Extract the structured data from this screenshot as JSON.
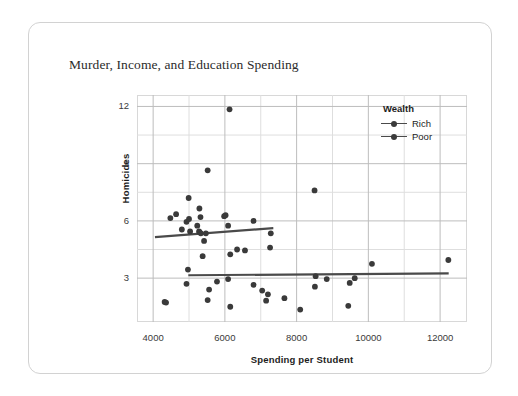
{
  "chart_data": {
    "type": "scatter",
    "title": "Murder, Income, and Education Spending",
    "xlabel": "Spending per Student",
    "ylabel": "Homicides",
    "xlim": [
      3550,
      12750
    ],
    "ylim": [
      0.7,
      12.6
    ],
    "xticks": [
      4000,
      6000,
      8000,
      10000,
      12000
    ],
    "xtick_labels": [
      "4000",
      "6000",
      "8000",
      "10000",
      "12000"
    ],
    "x_minor_ticks": [
      5000,
      7000,
      9000,
      11000
    ],
    "yticks": [
      3,
      6,
      9,
      12
    ],
    "ytick_labels": [
      "3",
      "6",
      "9",
      "12"
    ],
    "y_minor_ticks": [
      4.5,
      7.5,
      10.5
    ],
    "grid": true,
    "legend": {
      "title": "Wealth",
      "position": "top-right",
      "entries": [
        {
          "name": "Rich",
          "label": "Rich",
          "color": "#3a3a3a"
        },
        {
          "name": "Poor",
          "label": "Poor",
          "color": "#3a3a3a"
        }
      ]
    },
    "marker_color": "#3a3a3a",
    "trend_color": "#4a4a4a",
    "series": [
      {
        "name": "Rich",
        "label": "Rich",
        "points": [
          [
            4480,
            6.15
          ],
          [
            4640,
            6.35
          ],
          [
            4930,
            5.95
          ],
          [
            4990,
            7.2
          ],
          [
            5000,
            6.1
          ],
          [
            4800,
            5.55
          ],
          [
            5030,
            5.45
          ],
          [
            5290,
            6.65
          ],
          [
            5320,
            6.2
          ],
          [
            5230,
            5.75
          ],
          [
            5280,
            5.45
          ],
          [
            5300,
            5.4
          ],
          [
            5330,
            5.35
          ],
          [
            5470,
            5.35
          ],
          [
            5520,
            8.65
          ],
          [
            5420,
            4.95
          ],
          [
            5380,
            4.15
          ],
          [
            5980,
            6.25
          ],
          [
            6020,
            6.3
          ],
          [
            6090,
            5.75
          ],
          [
            6130,
            11.85
          ],
          [
            6150,
            4.25
          ],
          [
            6340,
            4.5
          ],
          [
            6560,
            4.45
          ],
          [
            6800,
            6.0
          ],
          [
            7280,
            5.35
          ],
          [
            7260,
            4.6
          ],
          [
            8500,
            7.6
          ]
        ],
        "trend": {
          "x0": 4050,
          "y0": 5.15,
          "x1": 7350,
          "y1": 5.62
        }
      },
      {
        "name": "Poor",
        "label": "Poor",
        "points": [
          [
            4320,
            1.75
          ],
          [
            4360,
            1.72
          ],
          [
            4970,
            3.45
          ],
          [
            4930,
            2.7
          ],
          [
            5560,
            2.4
          ],
          [
            5780,
            2.82
          ],
          [
            5520,
            1.85
          ],
          [
            6090,
            2.95
          ],
          [
            6150,
            1.5
          ],
          [
            6800,
            2.65
          ],
          [
            7040,
            2.35
          ],
          [
            7200,
            2.15
          ],
          [
            7150,
            1.82
          ],
          [
            7660,
            1.95
          ],
          [
            8100,
            1.35
          ],
          [
            8530,
            3.1
          ],
          [
            8510,
            2.55
          ],
          [
            8840,
            2.95
          ],
          [
            9440,
            1.55
          ],
          [
            9480,
            2.75
          ],
          [
            9620,
            3.0
          ],
          [
            10100,
            3.75
          ],
          [
            12230,
            3.95
          ]
        ],
        "trend": {
          "x0": 4980,
          "y0": 3.15,
          "x1": 12240,
          "y1": 3.25
        }
      }
    ]
  }
}
